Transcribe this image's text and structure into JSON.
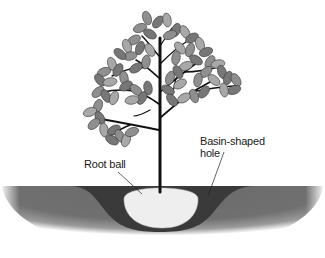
{
  "diagram": {
    "labels": {
      "root_ball": "Root ball",
      "basin_line1": "Basin-shaped",
      "basin_line2": "hole"
    },
    "colors": {
      "background": "#ffffff",
      "soil_outer": "#6e6e6e",
      "soil_edge": "#d0d0d0",
      "basin": "#3a3a3a",
      "root_ball": "#eeeeee",
      "trunk": "#111111",
      "leaf_dark": "#777777",
      "leaf_mid": "#8f8f8f",
      "leaf_light": "#a8a8a8",
      "leaf_outline": "#3c3c3c"
    }
  }
}
